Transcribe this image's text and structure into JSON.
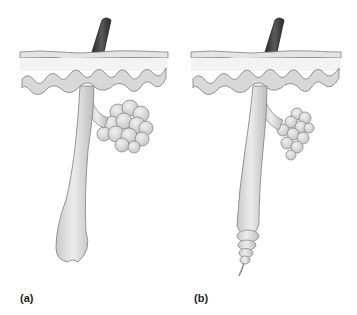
{
  "figure": {
    "panels": [
      {
        "id": "a",
        "label": "(a)",
        "description": "Hair follicle with large club-shaped base and sebaceous gland"
      },
      {
        "id": "b",
        "label": "(b)",
        "description": "Hair follicle with segmented tapering base and sebaceous gland"
      }
    ],
    "colors": {
      "hair_shaft": "#3a3a3a",
      "skin_surface": "#c8c8c8",
      "epidermis_outline": "#8a8a8a",
      "tissue_fill": "#d9d9d9",
      "tissue_shade": "#bdbdbd",
      "background": "#ffffff"
    }
  }
}
